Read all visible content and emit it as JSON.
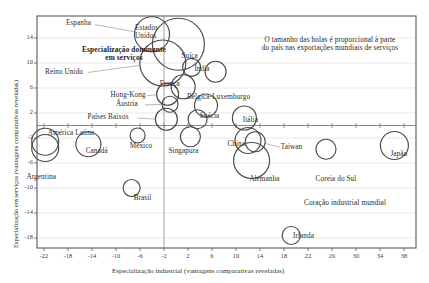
{
  "chart_data": {
    "type": "scatter",
    "subtype": "bubble",
    "title": "",
    "xlabel": "Especialização industrial (vantagens comparativas reveladas)",
    "ylabel": "Especialização em serviços (vantagens comparativas reveladas)",
    "xlim": [
      -24,
      40
    ],
    "ylim": [
      -19,
      16
    ],
    "xticks": [
      -22,
      -18,
      -14,
      -10,
      -6,
      -2,
      2,
      6,
      10,
      14,
      18,
      22,
      26,
      30,
      34,
      38
    ],
    "yticks": [
      14,
      10,
      6,
      2,
      -2,
      -6,
      -10,
      -14,
      -18
    ],
    "grid": true,
    "legend": "none",
    "size_meaning": "share of country in world services exports",
    "annotations": [
      {
        "name": "bubble-size-note",
        "text_line1": "O tamanho das bolas é proporcional à parte",
        "text_line2": "do país nas exportações mundiais de serviços",
        "x": 330,
        "y": 44
      },
      {
        "name": "dominant-services-note",
        "text_line1": "Especialização dominante",
        "text_line2": "em serviços",
        "x": 124,
        "y": 54
      },
      {
        "name": "industrial-core-note",
        "text_line1": "Coração industrial mundial",
        "text_line2": "",
        "x": 345,
        "y": 207
      }
    ],
    "points": [
      {
        "name": "Espanha",
        "x": -4.0,
        "y": 14.6,
        "r": 17.5,
        "label_x": 80,
        "label_y": 24,
        "leader": true
      },
      {
        "name": "Estados Unidos",
        "x": 0.4,
        "y": 13.0,
        "r": 26.0,
        "label_x": 155,
        "label_y": 28,
        "leader": true,
        "two_line": true
      },
      {
        "name": "Reino Unido",
        "x": -2.2,
        "y": 10.0,
        "r": 23.0,
        "label_x": 66,
        "label_y": 73,
        "leader": true
      },
      {
        "name": "Suíça",
        "x": 2.6,
        "y": 9.3,
        "r": 9.0,
        "label_x": 192,
        "label_y": 57,
        "leader": false
      },
      {
        "name": "Índia",
        "x": 6.6,
        "y": 8.6,
        "r": 10.5,
        "label_x": 205,
        "label_y": 70,
        "leader": false
      },
      {
        "name": "França",
        "x": 1.2,
        "y": 6.2,
        "r": 12.0,
        "label_x": 172,
        "label_y": 85,
        "leader": true
      },
      {
        "name": "Hong-Kong",
        "x": -1.4,
        "y": 5.0,
        "r": 11.0,
        "label_x": 128,
        "label_y": 96,
        "leader": true
      },
      {
        "name": "Áustria",
        "x": -1.0,
        "y": 3.4,
        "r": 8.0,
        "label_x": 130,
        "label_y": 105,
        "leader": true
      },
      {
        "name": "Bélgica-Luxemburgo",
        "x": 5.0,
        "y": 3.2,
        "r": 11.5,
        "label_x": 220,
        "label_y": 98,
        "leader": true
      },
      {
        "name": "Suécia",
        "x": 3.6,
        "y": 1.0,
        "r": 9.5,
        "label_x": 212,
        "label_y": 117,
        "leader": true
      },
      {
        "name": "Países Baixos",
        "x": -1.6,
        "y": 1.0,
        "r": 11.0,
        "label_x": 112,
        "label_y": 118,
        "leader": true
      },
      {
        "name": "Itália",
        "x": 11.4,
        "y": 1.2,
        "r": 12.0,
        "label_x": 255,
        "label_y": 121,
        "leader": false
      },
      {
        "name": "Singapura",
        "x": 2.4,
        "y": -1.8,
        "r": 10.0,
        "label_x": 186,
        "label_y": 152,
        "leader": true
      },
      {
        "name": "China",
        "x": 12.0,
        "y": -2.4,
        "r": 13.0,
        "label_x": 238,
        "label_y": 145,
        "leader": true
      },
      {
        "name": "Taiwan",
        "x": 13.2,
        "y": -2.6,
        "r": 10.0,
        "label_x": 293,
        "label_y": 148,
        "leader": true
      },
      {
        "name": "México",
        "x": -6.4,
        "y": -1.6,
        "r": 7.5,
        "label_x": 142,
        "label_y": 147,
        "leader": false
      },
      {
        "name": "América Latina",
        "x": -21.8,
        "y": -2.6,
        "r": 13.5,
        "label_x": 74,
        "label_y": 134,
        "leader": true
      },
      {
        "name": "Canadá",
        "x": -14.6,
        "y": -3.0,
        "r": 12.5,
        "label_x": 98,
        "label_y": 152,
        "leader": false
      },
      {
        "name": "Argentina",
        "x": -21.8,
        "y": -3.6,
        "r": 13.5,
        "label_x": 44,
        "label_y": 178,
        "leader": true
      },
      {
        "name": "Alemanha",
        "x": 12.6,
        "y": -5.6,
        "r": 18.0,
        "label_x": 265,
        "label_y": 180,
        "leader": false
      },
      {
        "name": "Coreia do Sul",
        "x": 25.0,
        "y": -3.8,
        "r": 10.0,
        "label_x": 340,
        "label_y": 180,
        "leader": false
      },
      {
        "name": "Japão",
        "x": 36.4,
        "y": -3.2,
        "r": 14.0,
        "label_x": 401,
        "label_y": 155,
        "leader": false
      },
      {
        "name": "Brasil",
        "x": -7.4,
        "y": -10.0,
        "r": 8.5,
        "label_x": 146,
        "label_y": 199,
        "leader": false
      },
      {
        "name": "Irlanda",
        "x": 19.2,
        "y": -17.6,
        "r": 9.0,
        "label_x": 307,
        "label_y": 237,
        "leader": false
      }
    ]
  }
}
